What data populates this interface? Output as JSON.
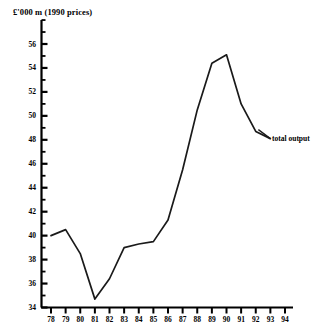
{
  "chart_data": {
    "type": "line",
    "title": "£'000 m  (1990 prices)",
    "xlabel": "",
    "ylabel": "",
    "x": [
      78,
      79,
      80,
      81,
      82,
      83,
      84,
      85,
      86,
      87,
      88,
      89,
      90,
      91,
      92,
      93
    ],
    "categories": [
      "78",
      "79",
      "80",
      "81",
      "82",
      "83",
      "84",
      "85",
      "86",
      "87",
      "88",
      "89",
      "90",
      "91",
      "92",
      "93"
    ],
    "series": [
      {
        "name": "total output",
        "values": [
          40.0,
          40.5,
          38.5,
          34.7,
          36.4,
          39.0,
          39.3,
          39.5,
          41.3,
          45.5,
          50.5,
          54.4,
          55.1,
          51.0,
          48.7,
          48.1
        ]
      }
    ],
    "xlim": [
      78,
      94
    ],
    "ylim": [
      34,
      58
    ],
    "ytick_labels": [
      "34",
      "36",
      "38",
      "40",
      "42",
      "44",
      "46",
      "48",
      "50",
      "52",
      "54",
      "56"
    ],
    "ytick_values": [
      34,
      36,
      38,
      40,
      42,
      44,
      46,
      48,
      50,
      52,
      54,
      56
    ],
    "yminor_step": 1,
    "ytop": 58,
    "xtick_labels": [
      "78",
      "79",
      "80",
      "81",
      "82",
      "83",
      "84",
      "85",
      "86",
      "87",
      "88",
      "89",
      "90",
      "91",
      "92",
      "93",
      "94"
    ],
    "xtick_values": [
      78,
      79,
      80,
      81,
      82,
      83,
      84,
      85,
      86,
      87,
      88,
      89,
      90,
      91,
      92,
      93,
      94
    ],
    "grid": false,
    "legend_position": "right-inline",
    "annotations": [
      {
        "text": "total output",
        "x": 93,
        "y": 48.1
      }
    ],
    "line_color": "#1a1a1a",
    "axis_color": "#000000",
    "background": "#ffffff"
  }
}
